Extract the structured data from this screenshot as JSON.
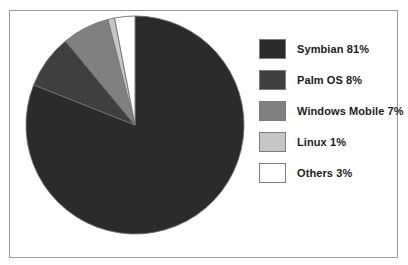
{
  "frame": {
    "border_color": "#9a9a9a",
    "background": "#ffffff"
  },
  "chart_data": {
    "type": "pie",
    "title": "",
    "subtitle": "",
    "xlabel": "",
    "ylabel": "",
    "grid": false,
    "legend_position": "right",
    "start_angle_deg": 0,
    "direction": "clockwise",
    "center": {
      "x": 110,
      "y": 110
    },
    "radius": 109,
    "categories": [
      "Symbian",
      "Palm OS",
      "Windows Mobile",
      "Linux",
      "Others"
    ],
    "values": [
      81,
      8,
      7,
      1,
      3
    ],
    "unit": "%",
    "slice_colors": [
      "#2b2b2b",
      "#3f3f3f",
      "#808080",
      "#c6c6c6",
      "#ffffff"
    ],
    "slice_border_color": "#6f6f6f",
    "slices": [
      {
        "label": "Symbian",
        "value": 81,
        "color": "#2b2b2b",
        "display": "Symbian 81%"
      },
      {
        "label": "Palm OS",
        "value": 8,
        "color": "#3f3f3f",
        "display": "Palm OS 8%"
      },
      {
        "label": "Windows Mobile",
        "value": 7,
        "color": "#808080",
        "display": "Windows Mobile 7%"
      },
      {
        "label": "Linux",
        "value": 1,
        "color": "#c6c6c6",
        "display": "Linux 1%"
      },
      {
        "label": "Others",
        "value": 3,
        "color": "#ffffff",
        "display": "Others 3%"
      }
    ]
  },
  "legend": {
    "items": [
      {
        "label": "Symbian 81%",
        "color": "#2b2b2b"
      },
      {
        "label": "Palm OS 8%",
        "color": "#3f3f3f"
      },
      {
        "label": "Windows Mobile 7%",
        "color": "#808080"
      },
      {
        "label": "Linux 1%",
        "color": "#c6c6c6"
      },
      {
        "label": "Others 3%",
        "color": "#ffffff"
      }
    ]
  }
}
